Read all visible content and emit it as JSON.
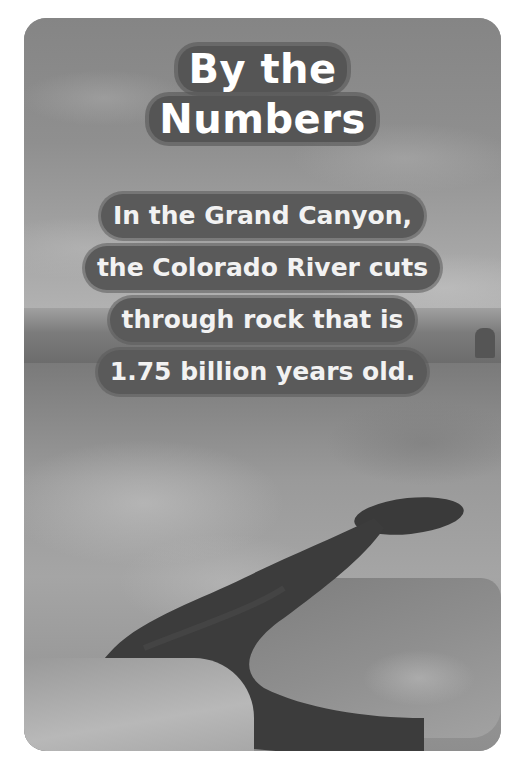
{
  "card": {
    "heading": {
      "line1": "By the",
      "line2": "Numbers"
    },
    "fact": {
      "lines": [
        "In the Grand Canyon,",
        "the Colorado River cuts",
        "through rock that is",
        "1.75 billion years old."
      ]
    },
    "photo": {
      "subject": "Aerial view of canyon with river (grayscale)"
    },
    "colors": {
      "text": "#ffffff",
      "text_outline": "#555555",
      "background": "#ffffff"
    }
  }
}
